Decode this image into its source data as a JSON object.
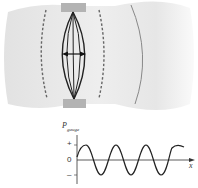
{
  "diagram": {
    "colors": {
      "wave_region": "#e4e4e4",
      "wave_edge": "#f6f6f6",
      "clamp": "#b3b3b3",
      "string": "#222222",
      "dashed_front": "#666666",
      "compression_front": "#888888",
      "axis": "#333333",
      "curve": "#222222"
    }
  },
  "graph": {
    "y_label_main": "P",
    "y_label_sub": "gauge",
    "y_ticks": [
      "+",
      "0",
      "–"
    ],
    "x_label": "x"
  }
}
